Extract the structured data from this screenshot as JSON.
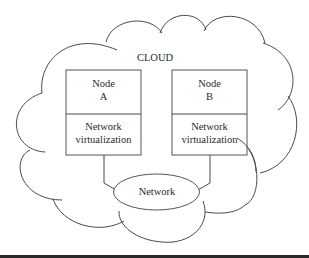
{
  "diagram": {
    "cloud_label": "CLOUD",
    "node_a": {
      "name_line1": "Node",
      "name_line2": "A",
      "layer_line1": "Network",
      "layer_line2": "virtualization"
    },
    "node_b": {
      "name_line1": "Node",
      "name_line2": "B",
      "layer_line1": "Network",
      "layer_line2": "virtualization"
    },
    "network_label": "Network",
    "colors": {
      "stroke": "#4a4a4a",
      "text": "#2b2b2b",
      "background": "#ffffff"
    }
  }
}
